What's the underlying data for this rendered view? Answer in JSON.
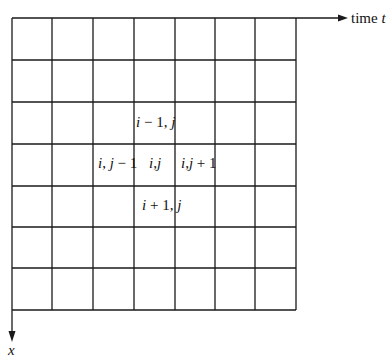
{
  "diagram": {
    "type": "finite-difference grid",
    "rows": 7,
    "cols": 7,
    "axis_horizontal": {
      "label": "time",
      "symbol": "t"
    },
    "axis_vertical": {
      "label": "",
      "symbol": "x"
    },
    "stencil_labels": [
      {
        "name": "i-1,j",
        "text": "i − 1, j"
      },
      {
        "name": "i,j-1",
        "text": "i, j − 1"
      },
      {
        "name": "i,j",
        "text": "i, j"
      },
      {
        "name": "i,j+1",
        "text": "i, j + 1"
      },
      {
        "name": "i+1,j",
        "text": "i + 1, j"
      }
    ],
    "line_color": "#1a1a1a"
  }
}
